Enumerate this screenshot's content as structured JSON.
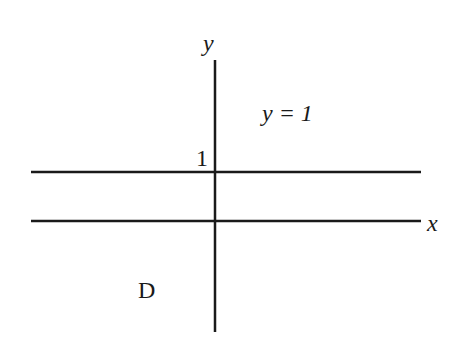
{
  "diagram": {
    "axes": {
      "x_label": "x",
      "y_label": "y"
    },
    "line": {
      "equation": "y = 1",
      "intercept_label": "1"
    },
    "region_label": "D",
    "colors": {
      "line": "#1a1a1a",
      "background": "#ffffff"
    }
  }
}
